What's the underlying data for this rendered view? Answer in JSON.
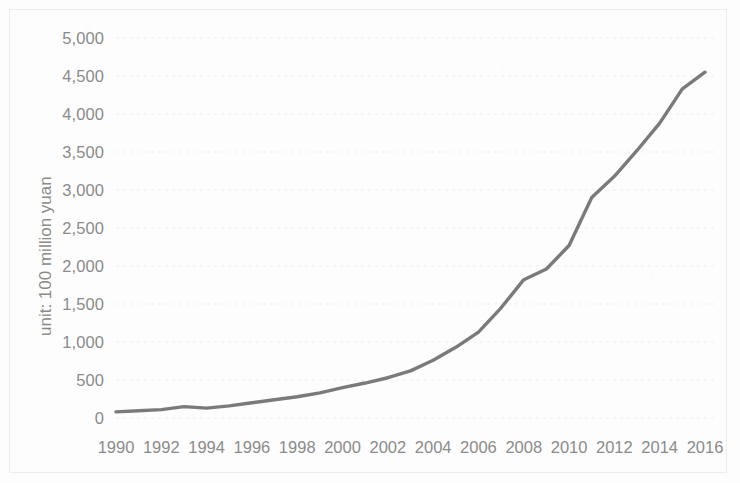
{
  "chart_data": {
    "type": "line",
    "title": "",
    "subtitle": "",
    "xlabel": "",
    "ylabel": "unit: 100 million yuan",
    "xlim": [
      1990,
      2016
    ],
    "ylim": [
      0,
      5000
    ],
    "ytick_step": 500,
    "xtick_step": 2,
    "grid": "horizontal-dotted",
    "legend": "none",
    "line_color": "#7a7a78",
    "gridline_color": "#ededec",
    "tick_label_color": "#8b8b89",
    "axis_title_color": "#8a8a88",
    "ytick_labels": [
      "5,000",
      "4,500",
      "4,000",
      "3,500",
      "3,000",
      "2,500",
      "2,000",
      "1,500",
      "1,000",
      "500",
      "0"
    ],
    "ytick_values": [
      5000,
      4500,
      4000,
      3500,
      3000,
      2500,
      2000,
      1500,
      1000,
      500,
      0
    ],
    "xtick_labels": [
      "1990",
      "1992",
      "1994",
      "1996",
      "1998",
      "2000",
      "2002",
      "2004",
      "2006",
      "2008",
      "2010",
      "2012",
      "2014",
      "2016"
    ],
    "xtick_values": [
      1990,
      1992,
      1994,
      1996,
      1998,
      2000,
      2002,
      2004,
      2006,
      2008,
      2010,
      2012,
      2014,
      2016
    ],
    "x": [
      1990,
      1991,
      1992,
      1993,
      1994,
      1995,
      1996,
      1997,
      1998,
      1999,
      2000,
      2001,
      2002,
      2003,
      2004,
      2005,
      2006,
      2007,
      2008,
      2009,
      2010,
      2011,
      2012,
      2013,
      2014,
      2015,
      2016
    ],
    "series": [
      {
        "name": "value",
        "values": [
          80,
          95,
          110,
          150,
          130,
          160,
          200,
          240,
          280,
          330,
          400,
          460,
          530,
          620,
          760,
          930,
          1130,
          1450,
          1820,
          1960,
          2270,
          2900,
          3180,
          3520,
          3880,
          4330,
          4550
        ]
      }
    ]
  }
}
